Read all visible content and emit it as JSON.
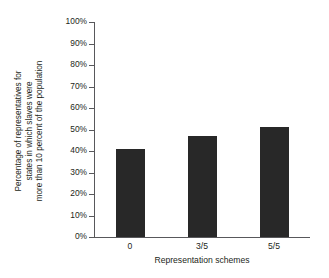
{
  "chart_data": {
    "type": "bar",
    "title": "",
    "categories": [
      "0",
      "3/5",
      "5/5"
    ],
    "values": [
      41,
      47,
      51
    ],
    "xlabel": "Representation schemes",
    "ylabel": "Percentage of representatives for states in which slaves were more than 10 percent of the population",
    "ylabel_lines": [
      "Percentage of representatives for",
      "states in which slaves were",
      "more than 10 percent of the population"
    ],
    "ylim": [
      0,
      100
    ],
    "ytick_labels": [
      "0%",
      "10%",
      "20%",
      "30%",
      "40%",
      "50%",
      "60%",
      "70%",
      "80%",
      "90%",
      "100%"
    ],
    "ytick_values": [
      0,
      10,
      20,
      30,
      40,
      50,
      60,
      70,
      80,
      90,
      100
    ],
    "grid": false,
    "legend": false,
    "bar_color": "#282828",
    "axis_color": "#58585b",
    "text_color": "#231f20",
    "background": "#ffffff"
  }
}
